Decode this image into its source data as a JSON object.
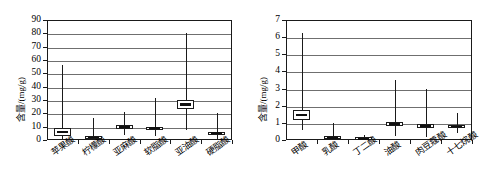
{
  "figure": {
    "background": "#ffffff",
    "axis_color": "#1a1a1a",
    "grid_color": "#6f6f6f"
  },
  "chart_data": [
    {
      "type": "box",
      "panel": "left",
      "title": "",
      "xlabel": "",
      "ylabel": "含量/(mg/g)",
      "ylim": [
        0,
        90
      ],
      "yticks": [
        0,
        10,
        20,
        30,
        40,
        50,
        60,
        70,
        80,
        90
      ],
      "ytick_labels": [
        "0",
        "10",
        "20",
        "30",
        "40",
        "50",
        "60",
        "70",
        "80",
        "90"
      ],
      "grid": true,
      "legend": "none",
      "categories": [
        "苹果酸",
        "柠檬酸",
        "亚麻酸",
        "软脂酸",
        "亚油酸",
        "硬脂酸"
      ],
      "boxes": [
        {
          "category": "苹果酸",
          "min": 0.5,
          "q1": 4.0,
          "median": 6.0,
          "q3": 9.5,
          "max": 56.5
        },
        {
          "category": "柠檬酸",
          "min": 0.2,
          "q1": 1.2,
          "median": 1.8,
          "q3": 3.0,
          "max": 16.5
        },
        {
          "category": "亚麻酸",
          "min": 4.0,
          "q1": 8.5,
          "median": 9.7,
          "q3": 11.0,
          "max": 20.8
        },
        {
          "category": "软脂酸",
          "min": 3.0,
          "q1": 7.8,
          "median": 8.8,
          "q3": 10.0,
          "max": 31.5
        },
        {
          "category": "亚油酸",
          "min": 7.5,
          "q1": 23.5,
          "median": 26.5,
          "q3": 30.0,
          "max": 80.0
        },
        {
          "category": "硬脂酸",
          "min": 1.0,
          "q1": 4.2,
          "median": 5.2,
          "q3": 6.5,
          "max": 20.6
        }
      ]
    },
    {
      "type": "box",
      "panel": "right",
      "title": "",
      "xlabel": "",
      "ylabel": "含量/(mg/g)",
      "ylim": [
        0,
        7
      ],
      "yticks": [
        0,
        1,
        2,
        3,
        4,
        5,
        6,
        7
      ],
      "ytick_labels": [
        "0",
        "1",
        "2",
        "3",
        "4",
        "5",
        "6",
        "7"
      ],
      "grid": true,
      "legend": "none",
      "categories": [
        "甲酸",
        "乳酸",
        "丁二酸",
        "油酸",
        "肉豆蔻酸",
        "十七烷酸"
      ],
      "boxes": [
        {
          "category": "甲酸",
          "min": 0.6,
          "q1": 1.25,
          "median": 1.45,
          "q3": 1.8,
          "max": 6.25
        },
        {
          "category": "乳酸",
          "min": 0.02,
          "q1": 0.08,
          "median": 0.12,
          "q3": 0.2,
          "max": 1.0
        },
        {
          "category": "丁二酸",
          "min": 0.01,
          "q1": 0.03,
          "median": 0.06,
          "q3": 0.1,
          "max": 0.28
        },
        {
          "category": "油酸",
          "min": 0.22,
          "q1": 0.82,
          "median": 0.94,
          "q3": 1.05,
          "max": 3.48
        },
        {
          "category": "肉豆蔻酸",
          "min": 0.18,
          "q1": 0.7,
          "median": 0.8,
          "q3": 0.92,
          "max": 3.0
        },
        {
          "category": "十七烷酸",
          "min": 0.38,
          "q1": 0.7,
          "median": 0.78,
          "q3": 0.9,
          "max": 1.58
        }
      ]
    }
  ]
}
